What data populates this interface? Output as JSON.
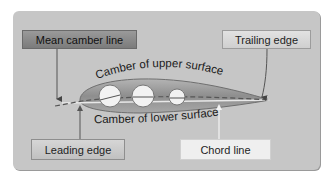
{
  "diagram": {
    "labels": {
      "mean_camber_line": "Mean camber line",
      "trailing_edge": "Trailing edge",
      "leading_edge": "Leading edge",
      "chord_line": "Chord line",
      "camber_upper": "Camber of upper surface",
      "camber_lower": "Camber of lower surface"
    },
    "colors": {
      "panel_bg": "#c6c6c6",
      "airfoil_fill": "#9e9e9e",
      "airfoil_outline": "#6e6e6e",
      "circle_fill": "#f2f2f2",
      "leader_line": "#555555",
      "chord_arrow": "#f4f4f4"
    }
  }
}
